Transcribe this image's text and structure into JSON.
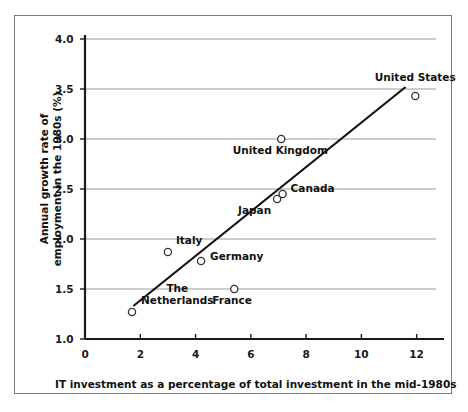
{
  "chart_data": {
    "type": "scatter",
    "title": "",
    "xlabel": "IT investment as a percentage of total investment in the mid-1980s",
    "ylabel": "Annual growth rate of employment in the 1980s (%)",
    "xlim": [
      0,
      12.7
    ],
    "ylim": [
      1.0,
      4.0
    ],
    "xticks": [
      "0",
      "2",
      "4",
      "6",
      "8",
      "10",
      "12"
    ],
    "xtick_values": [
      0,
      2,
      4,
      6,
      8,
      10,
      12
    ],
    "yticks": [
      "1.0",
      "1.5",
      "2.0",
      "2.5",
      "3.0",
      "3.5",
      "4.0"
    ],
    "ytick_values": [
      1.0,
      1.5,
      2.0,
      2.5,
      3.0,
      3.5,
      4.0
    ],
    "grid": "horizontal",
    "legend": "none",
    "marker": "open-circle",
    "points": [
      {
        "label": "The\nNetherlands",
        "name": "The Netherlands",
        "x": 1.7,
        "y": 1.27,
        "label_dx": 9,
        "label_dy": -12,
        "align": "left"
      },
      {
        "label": "Italy",
        "name": "Italy",
        "x": 3.0,
        "y": 1.87,
        "label_dx": 8,
        "label_dy": -12,
        "align": "left"
      },
      {
        "label": "Germany",
        "name": "Germany",
        "x": 4.2,
        "y": 1.78,
        "label_dx": 9,
        "label_dy": -5,
        "align": "left"
      },
      {
        "label": "France",
        "name": "France",
        "x": 5.4,
        "y": 1.5,
        "label_dx": -2,
        "label_dy": 5,
        "align": "center"
      },
      {
        "label": "Japan",
        "name": "Japan",
        "x": 6.95,
        "y": 2.4,
        "label_dx": -6,
        "label_dy": 5,
        "align": "right"
      },
      {
        "label": "Canada",
        "name": "Canada",
        "x": 7.15,
        "y": 2.45,
        "label_dx": 8,
        "label_dy": -6,
        "align": "left"
      },
      {
        "label": "United Kingdom",
        "name": "United Kingdom",
        "x": 7.1,
        "y": 3.0,
        "label_dx": -1,
        "label_dy": 5,
        "align": "center"
      },
      {
        "label": "United States",
        "name": "United States",
        "x": 11.95,
        "y": 3.43,
        "label_dx": 0,
        "label_dy": -19,
        "align": "center"
      }
    ],
    "trendline": {
      "x0": 1.75,
      "y0": 1.33,
      "x1": 11.6,
      "y1": 3.52
    },
    "colors": {
      "axis": "#1a1a1a",
      "grid": "#8f8f8f",
      "marker_stroke": "#333333",
      "marker_fill": "#ffffff",
      "trendline": "#111111",
      "frame": "#7a7a7a",
      "background": "#ffffff",
      "text": "#111111"
    }
  }
}
